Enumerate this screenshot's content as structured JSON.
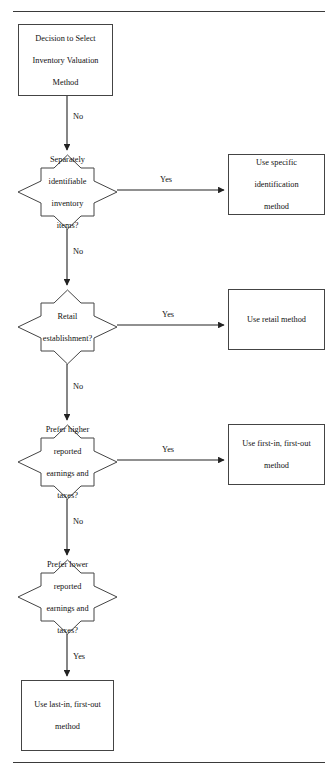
{
  "document": {
    "type": "flowchart",
    "title": "Inventory Valuation Method Decision Flowchart",
    "background": "#ffffff",
    "stroke_color": "#333333",
    "rule_color": "#3a3a3a",
    "text_color": "#111111"
  },
  "rules": {
    "top_label": "top-horizontal-rule",
    "bottom_label": "bottom-horizontal-rule"
  },
  "nodes": {
    "start": {
      "shape": "rectangle",
      "lines": [
        "Decision to Select",
        "Inventory Valuation",
        "Method"
      ]
    },
    "decision1": {
      "shape": "decision-star",
      "lines": [
        "Separately",
        "identifiable",
        "inventory",
        "items?"
      ]
    },
    "decision2": {
      "shape": "decision-star",
      "lines": [
        "Retail",
        "establishment?"
      ]
    },
    "decision3": {
      "shape": "decision-star",
      "lines": [
        "Prefer higher",
        "reported",
        "earnings and",
        "taxes?"
      ]
    },
    "decision4": {
      "shape": "decision-star",
      "lines": [
        "Prefer lower",
        "reported",
        "earnings and",
        "taxes?"
      ]
    },
    "outcome1": {
      "shape": "rectangle",
      "lines": [
        "Use specific",
        "identification",
        "method"
      ]
    },
    "outcome2": {
      "shape": "rectangle",
      "lines": [
        "Use retail method"
      ]
    },
    "outcome3": {
      "shape": "rectangle",
      "lines": [
        "Use first-in, first-out",
        "method"
      ]
    },
    "outcome4": {
      "shape": "rectangle",
      "lines": [
        "Use last-in, first-out",
        "method"
      ]
    }
  },
  "edges": {
    "start_to_d1": "No",
    "d1_to_outcome1": "Yes",
    "d1_to_d2": "No",
    "d2_to_outcome2": "Yes",
    "d2_to_d3": "No",
    "d3_to_outcome3": "Yes",
    "d3_to_d4": "No",
    "d4_to_outcome4": "Yes"
  }
}
